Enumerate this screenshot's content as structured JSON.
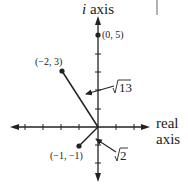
{
  "axes": {
    "imaginary_label_italic": "i",
    "imaginary_label_rest": " axis",
    "real_label_line1": "real",
    "real_label_line2": "axis"
  },
  "points": [
    {
      "label": "(0, 5)",
      "x": 0,
      "y": 5
    },
    {
      "label": "(−2, 3)",
      "x": -2,
      "y": 3
    },
    {
      "label": "(−1, −1)",
      "x": -1,
      "y": -1
    }
  ],
  "annotations": [
    {
      "radicand": "13",
      "symbol": "√",
      "target": "segment to (−2, 3)"
    },
    {
      "radicand": "2",
      "symbol": "√",
      "target": "segment to (−1, −1)"
    }
  ],
  "colors": {
    "ink": "#222222",
    "marker": "#999999"
  }
}
